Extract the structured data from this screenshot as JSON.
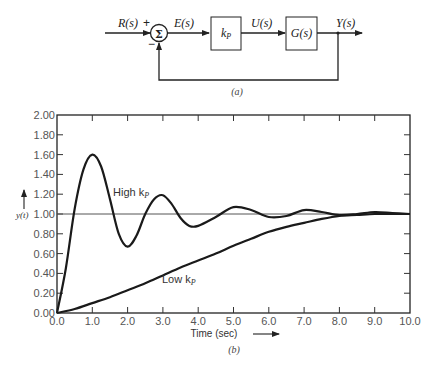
{
  "block_diagram": {
    "caption": "(a)",
    "input_label": "R(s)",
    "plus_sign": "+",
    "minus_sign": "−",
    "summing_symbol": "Σ",
    "error_label": "E(s)",
    "controller_block": "k",
    "controller_subscript": "P",
    "control_label": "U(s)",
    "plant_block": "G(s)",
    "output_label": "Y(s)"
  },
  "chart": {
    "caption": "(b)",
    "xlabel": "Time (sec)",
    "ylabel": "y(t)",
    "high_label": "High k",
    "low_label": "Low k",
    "subscript": "P"
  },
  "chart_data": {
    "type": "line",
    "title": "",
    "xlabel": "Time (sec)",
    "ylabel": "y(t)",
    "xlim": [
      0,
      10
    ],
    "ylim": [
      0,
      2
    ],
    "x_ticks": [
      "0.0",
      "1.0",
      "2.0",
      "3.0",
      "4.0",
      "5.0",
      "6.0",
      "7.0",
      "8.0",
      "9.0",
      "10.0"
    ],
    "y_ticks": [
      "0.00",
      "0.20",
      "0.40",
      "0.60",
      "0.80",
      "1.00",
      "1.20",
      "1.40",
      "1.60",
      "1.80",
      "2.00"
    ],
    "grid": false,
    "reference_line": 1.0,
    "series": [
      {
        "name": "High kP",
        "x": [
          0.0,
          0.25,
          0.5,
          0.75,
          1.0,
          1.25,
          1.5,
          1.75,
          2.0,
          2.25,
          2.5,
          2.75,
          3.0,
          3.25,
          3.5,
          3.75,
          4.0,
          4.5,
          5.0,
          5.5,
          6.0,
          6.5,
          7.0,
          7.5,
          8.0,
          8.5,
          9.0,
          9.5,
          10.0
        ],
        "y": [
          0.0,
          0.45,
          1.05,
          1.45,
          1.6,
          1.48,
          1.15,
          0.8,
          0.67,
          0.78,
          1.0,
          1.15,
          1.19,
          1.1,
          0.96,
          0.88,
          0.88,
          0.97,
          1.07,
          1.04,
          0.97,
          0.98,
          1.04,
          1.02,
          0.99,
          1.0,
          1.02,
          1.01,
          1.0
        ]
      },
      {
        "name": "Low kP",
        "x": [
          0.0,
          0.5,
          1.0,
          1.5,
          2.0,
          2.5,
          3.0,
          3.5,
          4.0,
          4.5,
          5.0,
          5.5,
          6.0,
          6.5,
          7.0,
          7.5,
          8.0,
          8.5,
          9.0,
          9.5,
          10.0
        ],
        "y": [
          0.0,
          0.04,
          0.1,
          0.16,
          0.23,
          0.3,
          0.38,
          0.46,
          0.53,
          0.6,
          0.68,
          0.75,
          0.82,
          0.87,
          0.91,
          0.95,
          0.98,
          0.99,
          1.0,
          1.0,
          1.0
        ]
      }
    ],
    "annotations": [
      {
        "text": "High kP",
        "x": 2.3,
        "y": 1.25
      },
      {
        "text": "Low kP",
        "x": 3.9,
        "y": 0.15
      }
    ],
    "legend_position": "none"
  }
}
